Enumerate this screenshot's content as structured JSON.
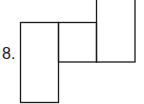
{
  "problem": {
    "number_label": "8."
  },
  "figure": {
    "stroke_color": "#1a1a1a",
    "rects": [
      {
        "name": "left-tall-rect",
        "x": 20.5,
        "y": 22.5,
        "w": 38,
        "h": 80
      },
      {
        "name": "middle-square",
        "x": 58.5,
        "y": 22.5,
        "w": 38,
        "h": 39.5
      },
      {
        "name": "right-tall-rect",
        "x": 96.5,
        "y": -2,
        "w": 38.5,
        "h": 64
      }
    ]
  }
}
